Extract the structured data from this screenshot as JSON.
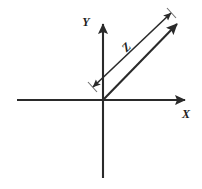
{
  "figure": {
    "kind": "vector-diagram",
    "background_color": "#ffffff",
    "stroke_color": "#2a2a2a",
    "label_color": "#1d1d1d",
    "width": 202,
    "height": 189
  },
  "axes": {
    "origin": {
      "x": 103,
      "y": 100
    },
    "x_axis": {
      "label": "X",
      "label_x": 186,
      "label_y": 118,
      "x1": 17,
      "y1": 100,
      "x2": 185,
      "y2": 100,
      "stroke_width": 2.1,
      "arrow": "right"
    },
    "y_axis": {
      "label": "Y",
      "label_x": 86,
      "label_y": 26,
      "x1": 103,
      "y1": 178,
      "x2": 103,
      "y2": 24,
      "stroke_width": 2.1,
      "arrow": "up"
    }
  },
  "vector": {
    "name": "resultant-vector",
    "x1": 103,
    "y1": 100,
    "x2": 177,
    "y2": 24,
    "stroke_width": 2.1,
    "arrow": "tip"
  },
  "dimension": {
    "label": "Z",
    "label_x": 129,
    "label_y": 50,
    "label_rotation": -45,
    "x1": 93,
    "y1": 87,
    "x2": 171,
    "y2": 13,
    "stroke_width": 1.5,
    "arrow": "both",
    "tick_start": {
      "x1": 88,
      "y1": 82,
      "x2": 97,
      "y2": 92
    },
    "tick_end": {
      "x1": 167,
      "y1": 8,
      "x2": 176,
      "y2": 18
    }
  }
}
